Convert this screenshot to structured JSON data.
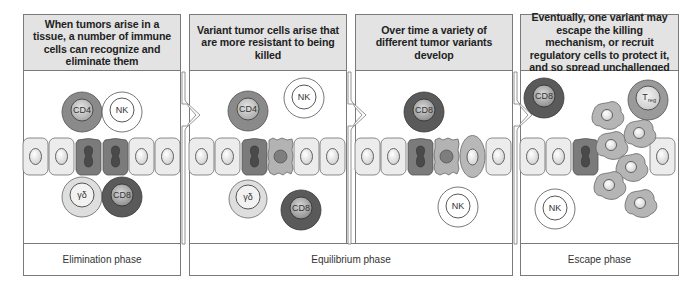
{
  "panels": [
    {
      "id": "elimination",
      "header": "When tumors arise in a tissue, a number of immune cells can recognize and eliminate them"
    },
    {
      "id": "equilibrium-1",
      "header": "Variant tumor cells arise that are more resistant to being killed"
    },
    {
      "id": "equilibrium-2",
      "header": "Over time a variety of different tumor variants develop"
    },
    {
      "id": "escape",
      "header": "Eventually, one variant may escape the killing mechanism, or recruit regulatory cells to protect it, and so spread unchallenged"
    }
  ],
  "phases": [
    {
      "label": "Elimination phase"
    },
    {
      "label": "Equilibrium phase"
    },
    {
      "label": "Escape phase"
    }
  ],
  "cell_labels": {
    "cd4": "CD4",
    "nk": "NK",
    "cd8": "CD8",
    "gamma_delta": "γδ",
    "treg_main": "T",
    "treg_sub": "reg"
  },
  "colors": {
    "header_bg": "#e3e3e3",
    "border": "#7a7a7a",
    "normal_cell": "#ececec",
    "tumor_cell": "#7b7b7b",
    "variant_cell": "#b3b3b3",
    "cd8_outer": "#5a5a5a",
    "cd4_outer": "#8a8a8a",
    "treg_outer": "#9a9a9a",
    "gd_outer": "#dedede"
  }
}
